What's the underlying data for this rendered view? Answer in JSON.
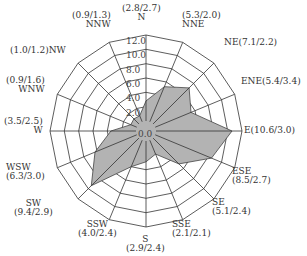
{
  "chart_data": {
    "type": "radar",
    "title": "",
    "categories": [
      "N",
      "NNE",
      "NE",
      "ENE",
      "E",
      "ESE",
      "SE",
      "SSE",
      "S",
      "SSW",
      "SW",
      "WSW",
      "W",
      "WNW",
      "NW",
      "NNW"
    ],
    "series": [
      {
        "name": "Frequency",
        "values": [
          2.8,
          5.3,
          7.1,
          5.4,
          10.6,
          8.5,
          5.1,
          2.1,
          2.9,
          4.0,
          9.4,
          6.3,
          3.5,
          0.9,
          1.0,
          0.9
        ],
        "fill": "#b3b3b3"
      },
      {
        "name": "Mean speed",
        "values": [
          2.7,
          2.0,
          2.2,
          3.4,
          3.0,
          2.7,
          2.4,
          2.1,
          2.4,
          2.4,
          2.9,
          3.0,
          2.5,
          1.6,
          1.2,
          1.3
        ]
      }
    ],
    "ring_ticks": [
      "0.0",
      "2.0",
      "4.0",
      "6.0",
      "8.0",
      "10.0",
      "12.0"
    ],
    "rlim": [
      0,
      12
    ],
    "grid": true,
    "legend": "none"
  },
  "labels": [
    {
      "dir": "N",
      "text": "(2.8/2.7)\nN"
    },
    {
      "dir": "NNE",
      "text": "(5.3/2.0)\nNNE"
    },
    {
      "dir": "NE",
      "text": "NE(7.1/2.2)"
    },
    {
      "dir": "ENE",
      "text": "ENE(5.4/3.4)"
    },
    {
      "dir": "E",
      "text": "E(10.6/3.0)"
    },
    {
      "dir": "ESE",
      "text": "ESE\n(8.5/2.7)"
    },
    {
      "dir": "SE",
      "text": "SE\n(5.1/2.4)"
    },
    {
      "dir": "SSE",
      "text": "SSE\n(2.1/2.1)"
    },
    {
      "dir": "S",
      "text": "S\n(2.9/2.4)"
    },
    {
      "dir": "SSW",
      "text": "SSW\n(4.0/2.4)"
    },
    {
      "dir": "SW",
      "text": "SW\n(9.4/2.9)"
    },
    {
      "dir": "WSW",
      "text": "WSW\n(6.3/3.0)"
    },
    {
      "dir": "W",
      "text": "(3.5/2.5)\nW"
    },
    {
      "dir": "WNW",
      "text": "(0.9/1.6)\nWNW"
    },
    {
      "dir": "NW",
      "text": "(1.0/1.2)NW"
    },
    {
      "dir": "NNW",
      "text": "(0.9/1.3)\nNNW"
    }
  ]
}
